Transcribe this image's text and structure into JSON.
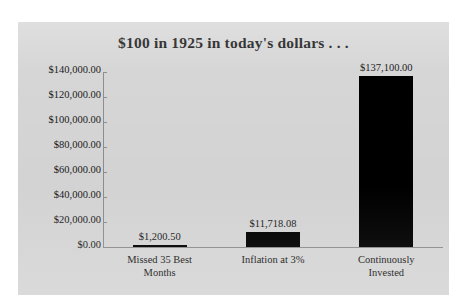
{
  "chart_data": {
    "type": "bar",
    "title": "$100 in 1925 in today's dollars . . .",
    "xlabel": "",
    "ylabel": "",
    "categories": [
      "Missed 35 Best Months",
      "Inflation at 3%",
      "Continuously Invested"
    ],
    "values": [
      1200.5,
      11718.08,
      137100.0
    ],
    "value_labels": [
      "$1,200.50",
      "$11,718.08",
      "$137,100.00"
    ],
    "ylim": [
      0,
      140000
    ],
    "ytick_values": [
      0,
      20000,
      40000,
      60000,
      80000,
      100000,
      120000,
      140000
    ],
    "ytick_labels": [
      "$0.00",
      "$20,000.00",
      "$40,000.00",
      "$60,000.00",
      "$80,000.00",
      "$100,000.00",
      "$120,000.00",
      "$140,000.00"
    ],
    "grid": false,
    "legend": false,
    "series": [
      {
        "name": "value",
        "values": [
          1200.5,
          11718.08,
          137100.0
        ]
      }
    ],
    "colors": {
      "bar": "#000000",
      "panel_background": "#d6d6d6",
      "page_background": "#ffffff",
      "axis": "#8e8e8e",
      "text": "#1a1a1a"
    }
  },
  "category_lines": [
    [
      "Missed 35 Best",
      "Months"
    ],
    [
      "Inflation at 3%",
      ""
    ],
    [
      "Continuously",
      "Invested"
    ]
  ]
}
